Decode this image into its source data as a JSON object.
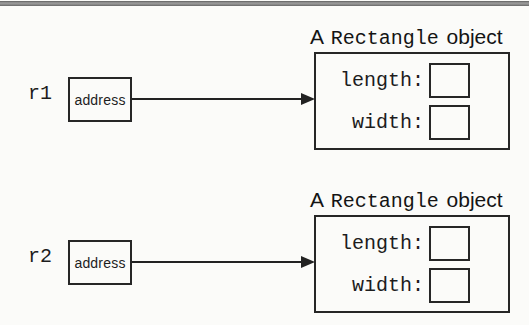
{
  "colors": {
    "ink": "#1d1d1d",
    "rule_gray": "#8e8e8e",
    "paper": "#fbfbf9"
  },
  "diagram": {
    "rows": [
      {
        "reference_label": "r1",
        "pointer_label": "address",
        "title": {
          "article": "A",
          "class_name": "Rectangle",
          "noun": "object"
        },
        "fields": [
          {
            "label": "length:",
            "value": ""
          },
          {
            "label": "width:",
            "value": ""
          }
        ]
      },
      {
        "reference_label": "r2",
        "pointer_label": "address",
        "title": {
          "article": "A",
          "class_name": "Rectangle",
          "noun": "object"
        },
        "fields": [
          {
            "label": "length:",
            "value": ""
          },
          {
            "label": "width:",
            "value": ""
          }
        ]
      }
    ]
  }
}
